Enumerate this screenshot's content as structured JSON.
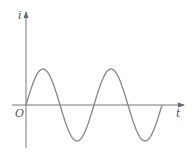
{
  "diagram": {
    "type": "sinusoidal waveform",
    "y_axis_label": "i",
    "x_axis_label": "t",
    "origin_label": "O",
    "curve": {
      "function": "sine",
      "cycles_shown": 2,
      "starts_at_origin": true,
      "initial_direction": "rising"
    },
    "colors": {
      "axes": "#777777",
      "curve": "#888888",
      "labels": "#555555"
    }
  }
}
